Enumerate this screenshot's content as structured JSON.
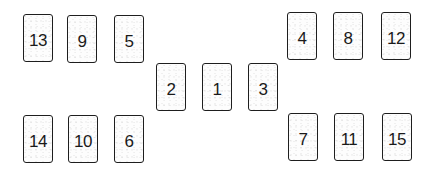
{
  "diagram": {
    "type": "card-spread-layout",
    "cards": [
      {
        "id": "card-1",
        "label": "1",
        "x": 202,
        "y": 63,
        "group": "center"
      },
      {
        "id": "card-2",
        "label": "2",
        "x": 156,
        "y": 63,
        "group": "center"
      },
      {
        "id": "card-3",
        "label": "3",
        "x": 248,
        "y": 63,
        "group": "center"
      },
      {
        "id": "card-4",
        "label": "4",
        "x": 287,
        "y": 12,
        "group": "right-top"
      },
      {
        "id": "card-5",
        "label": "5",
        "x": 114,
        "y": 15,
        "group": "left-top"
      },
      {
        "id": "card-6",
        "label": "6",
        "x": 114,
        "y": 115,
        "group": "left-bottom"
      },
      {
        "id": "card-7",
        "label": "7",
        "x": 288,
        "y": 113,
        "group": "right-bottom"
      },
      {
        "id": "card-8",
        "label": "8",
        "x": 333,
        "y": 12,
        "group": "right-top"
      },
      {
        "id": "card-9",
        "label": "9",
        "x": 67,
        "y": 15,
        "group": "left-top"
      },
      {
        "id": "card-10",
        "label": "10",
        "x": 68,
        "y": 115,
        "group": "left-bottom"
      },
      {
        "id": "card-11",
        "label": "11",
        "x": 334,
        "y": 113,
        "group": "right-bottom"
      },
      {
        "id": "card-12",
        "label": "12",
        "x": 381,
        "y": 12,
        "group": "right-top"
      },
      {
        "id": "card-13",
        "label": "13",
        "x": 23,
        "y": 14,
        "group": "left-top"
      },
      {
        "id": "card-14",
        "label": "14",
        "x": 23,
        "y": 115,
        "group": "left-bottom"
      },
      {
        "id": "card-15",
        "label": "15",
        "x": 382,
        "y": 113,
        "group": "right-bottom"
      }
    ]
  },
  "colors": {
    "background": "#ffffff",
    "card_border": "#1e1e1e",
    "card_fill": "#fdfdfd",
    "text": "#1a1a1a"
  }
}
